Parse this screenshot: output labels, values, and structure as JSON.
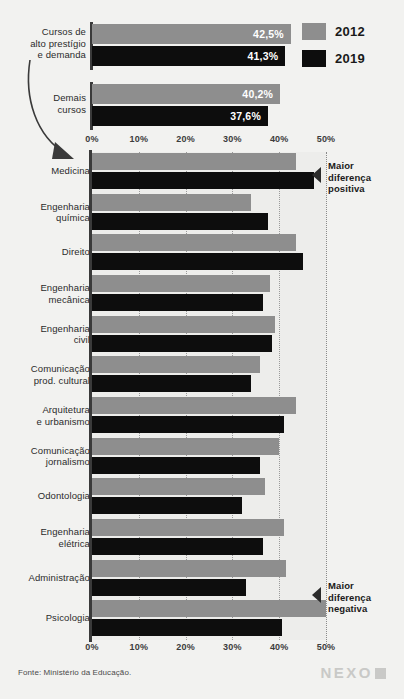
{
  "legend": {
    "items": [
      {
        "label": "2012",
        "color": "#8e8e8e"
      },
      {
        "label": "2019",
        "color": "#0d0d0d"
      }
    ]
  },
  "summary": {
    "rows": [
      {
        "label": "Cursos de\nalto prestígio\ne demanda",
        "v2012": 42.5,
        "v2019": 41.3,
        "d2012": "42,5%",
        "d2019": "41,3%"
      },
      {
        "label": "Demais\ncursos",
        "v2012": 40.2,
        "v2019": 37.6,
        "d2012": "40,2%",
        "d2019": "37,6%"
      }
    ]
  },
  "annotations": {
    "positive": "Maior\ndiferença\npositiva",
    "negative": "Maior\ndiferença\nnegativa"
  },
  "footer": {
    "source": "Fonte: Ministério da Educação.",
    "logo": "NEXO"
  },
  "chart_data": {
    "type": "bar",
    "orientation": "horizontal",
    "title": "",
    "xlabel": "",
    "ylabel": "",
    "xlim": [
      0,
      50
    ],
    "grid": true,
    "legend_position": "top-right",
    "tick_labels": [
      "0%",
      "10%",
      "20%",
      "30%",
      "40%",
      "50%"
    ],
    "ticks": [
      0,
      10,
      20,
      30,
      40,
      50
    ],
    "categories": [
      "Medicina",
      "Engenharia\nquímica",
      "Direito",
      "Engenharia\nmecânica",
      "Engenharia\ncivil",
      "Comunicação\nprod. cultural",
      "Arquitetura\ne urbanismo",
      "Comunicação\njornalismo",
      "Odontologia",
      "Engenharia\nelétrica",
      "Administração",
      "Psicologia"
    ],
    "series": [
      {
        "name": "2012",
        "color": "#8e8e8e",
        "values": [
          43.5,
          34.0,
          43.5,
          38.0,
          39.0,
          36.0,
          43.5,
          40.0,
          37.0,
          41.0,
          41.5,
          50.0
        ]
      },
      {
        "name": "2019",
        "color": "#0d0d0d",
        "values": [
          47.5,
          37.5,
          45.0,
          36.5,
          38.5,
          34.0,
          41.0,
          36.0,
          32.0,
          36.5,
          33.0,
          40.5
        ]
      }
    ],
    "annotated_categories": {
      "Medicina": "Maior diferença positiva",
      "Psicologia": "Maior diferença negativa"
    }
  }
}
